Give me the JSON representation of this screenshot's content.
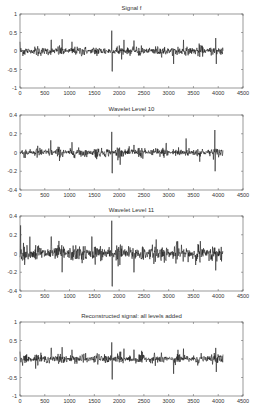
{
  "chart_data": [
    {
      "type": "line",
      "title": "Signal f",
      "xlabel": "",
      "ylabel": "",
      "xlim": [
        0,
        4500
      ],
      "ylim": [
        -1,
        1
      ],
      "xticks": [
        0,
        500,
        1000,
        1500,
        2000,
        2500,
        3000,
        3500,
        4000,
        4500
      ],
      "yticks": [
        -1,
        -0.5,
        0,
        0.5,
        1
      ],
      "ytick_labels": [
        "-1",
        "-0.5",
        "0",
        "0.5",
        "1"
      ],
      "grid": false,
      "series": [
        {
          "name": "f",
          "n_samples": 4096,
          "typical_amplitude": 0.1,
          "spikes": [
            [
              0,
              0.25
            ],
            [
              630,
              0.3
            ],
            [
              850,
              0.32
            ],
            [
              1050,
              0.25
            ],
            [
              1850,
              0.55
            ],
            [
              1860,
              -0.55
            ],
            [
              2100,
              0.3
            ],
            [
              2300,
              0.28
            ],
            [
              3100,
              -0.35
            ],
            [
              3300,
              0.3
            ],
            [
              3950,
              0.35
            ],
            [
              3960,
              -0.35
            ]
          ]
        }
      ]
    },
    {
      "type": "line",
      "title": "Wavelet Level 10",
      "xlim": [
        0,
        4500
      ],
      "ylim": [
        -0.4,
        0.4
      ],
      "xticks": [
        0,
        500,
        1000,
        1500,
        2000,
        2500,
        3000,
        3500,
        4000,
        4500
      ],
      "yticks": [
        -0.4,
        -0.2,
        0,
        0.2,
        0.4
      ],
      "ytick_labels": [
        "-0.4",
        "-0.2",
        "0",
        "0.2",
        "0.4"
      ],
      "grid": false,
      "series": [
        {
          "name": "level10",
          "n_samples": 4096,
          "typical_amplitude": 0.04,
          "spikes": [
            [
              620,
              0.13
            ],
            [
              1050,
              0.11
            ],
            [
              1850,
              0.22
            ],
            [
              1860,
              -0.22
            ],
            [
              2300,
              0.08
            ],
            [
              2950,
              0.1
            ],
            [
              3350,
              0.15
            ],
            [
              3930,
              0.24
            ],
            [
              3940,
              -0.2
            ]
          ]
        }
      ]
    },
    {
      "type": "line",
      "title": "Wavelet Level 11",
      "xlim": [
        0,
        4500
      ],
      "ylim": [
        -0.4,
        0.4
      ],
      "xticks": [
        0,
        500,
        1000,
        1500,
        2000,
        2500,
        3000,
        3500,
        4000,
        4500
      ],
      "yticks": [
        -0.4,
        -0.2,
        0,
        0.2,
        0.4
      ],
      "ytick_labels": [
        "-0.4",
        "-0.2",
        "0",
        "0.2",
        "0.4"
      ],
      "grid": false,
      "series": [
        {
          "name": "level11",
          "n_samples": 4096,
          "typical_amplitude": 0.07,
          "spikes": [
            [
              10,
              0.3
            ],
            [
              200,
              0.18
            ],
            [
              630,
              0.18
            ],
            [
              850,
              0.2
            ],
            [
              850,
              -0.2
            ],
            [
              1450,
              0.18
            ],
            [
              1850,
              0.35
            ],
            [
              1860,
              -0.35
            ],
            [
              2300,
              0.2
            ],
            [
              2300,
              -0.2
            ],
            [
              2750,
              0.15
            ],
            [
              3950,
              0.17
            ],
            [
              3950,
              -0.18
            ]
          ]
        }
      ]
    },
    {
      "type": "line",
      "title": "Reconstructed signal: all levels added",
      "xlim": [
        0,
        4500
      ],
      "ylim": [
        -1,
        1
      ],
      "xticks": [
        0,
        500,
        1000,
        1500,
        2000,
        2500,
        3000,
        3500,
        4000,
        4500
      ],
      "yticks": [
        -1,
        -0.5,
        0,
        0.5,
        1
      ],
      "ytick_labels": [
        "-1",
        "-0.5",
        "0",
        "0.5",
        "1"
      ],
      "grid": false,
      "series": [
        {
          "name": "reconstructed",
          "n_samples": 4096,
          "typical_amplitude": 0.1,
          "spikes": [
            [
              0,
              0.2
            ],
            [
              630,
              0.3
            ],
            [
              850,
              0.32
            ],
            [
              1050,
              0.25
            ],
            [
              1850,
              0.45
            ],
            [
              1860,
              -0.55
            ],
            [
              2100,
              0.28
            ],
            [
              2300,
              0.25
            ],
            [
              3100,
              -0.4
            ],
            [
              3300,
              0.28
            ],
            [
              3950,
              0.3
            ],
            [
              3960,
              -0.35
            ]
          ]
        }
      ]
    }
  ],
  "panels": [
    {
      "title": "Signal f"
    },
    {
      "title": "Wavelet Level 10"
    },
    {
      "title": "Wavelet Level 11"
    },
    {
      "title": "Reconstructed signal: all levels added"
    }
  ]
}
